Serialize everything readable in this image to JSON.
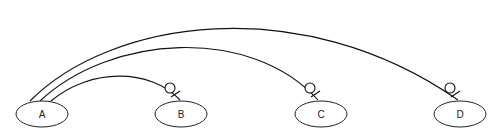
{
  "diagram": {
    "type": "er-relationship",
    "nodes": [
      {
        "id": "A",
        "label": "A",
        "cx": 42,
        "cy": 114
      },
      {
        "id": "B",
        "label": "B",
        "cx": 181,
        "cy": 114
      },
      {
        "id": "C",
        "label": "C",
        "cx": 321,
        "cy": 114
      },
      {
        "id": "D",
        "label": "D",
        "cx": 460,
        "cy": 114
      }
    ],
    "edges": [
      {
        "from": "A",
        "to": "B",
        "end_marker": "zero-or-one"
      },
      {
        "from": "A",
        "to": "C",
        "end_marker": "zero-or-one"
      },
      {
        "from": "A",
        "to": "D",
        "end_marker": "zero-or-one"
      }
    ]
  }
}
